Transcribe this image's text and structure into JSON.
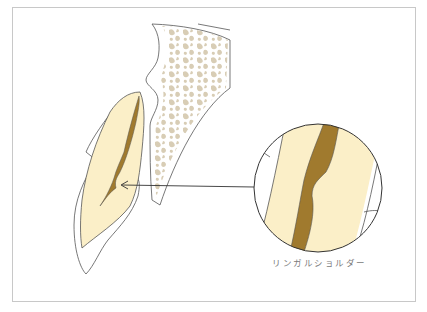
{
  "diagram": {
    "label": "リンガルショルダー",
    "colors": {
      "dentin": "#fbefc8",
      "pulp": "#a07a2e",
      "bone_trabeculae": "#d8cdb5",
      "outline": "#555555",
      "frame": "#c8c8c8",
      "label_text": "#7a7a7a"
    },
    "elements": [
      "tooth-crown-cross-section",
      "pulp-chamber",
      "gingiva-outline",
      "alveolar-bone",
      "pointer-arrow",
      "magnified-circle-detail"
    ]
  }
}
